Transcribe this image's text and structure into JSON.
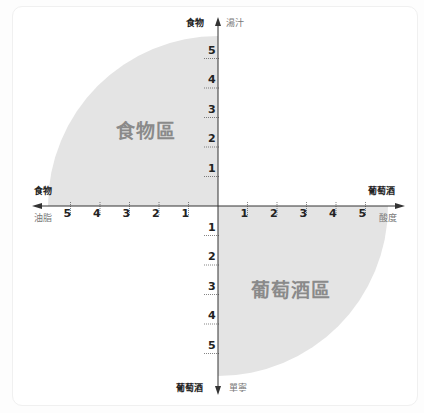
{
  "diagram": {
    "origin": {
      "x": 218,
      "y": 206
    },
    "tick_spacing_px": 29.5,
    "colors": {
      "fill": "#e4e4e4",
      "axis": "#333333",
      "background": "#ffffff"
    },
    "axes": {
      "top": {
        "bold_label": "食物",
        "light_label": "湯汁"
      },
      "bottom": {
        "bold_label": "葡萄酒",
        "light_label": "單寧"
      },
      "left": {
        "bold_label": "食物",
        "light_label": "油脂"
      },
      "right": {
        "bold_label": "葡萄酒",
        "light_label": "酸度"
      }
    },
    "ticks": {
      "up": [
        "1",
        "2",
        "3",
        "4",
        "5"
      ],
      "down": [
        "1",
        "2",
        "3",
        "4",
        "5"
      ],
      "left": [
        "1",
        "2",
        "3",
        "4",
        "5"
      ],
      "right": [
        "1",
        "2",
        "3",
        "4",
        "5"
      ]
    },
    "zones": {
      "top_left": "食物區",
      "bottom_right": "葡萄酒區"
    }
  },
  "chart_data": {
    "type": "scatter",
    "title": "",
    "xlabel_positive": "葡萄酒 酸度",
    "xlabel_negative": "食物 油脂",
    "ylabel_positive": "食物 湯汁",
    "ylabel_negative": "葡萄酒 單寧",
    "x_ticks": [
      -5,
      -4,
      -3,
      -2,
      -1,
      1,
      2,
      3,
      4,
      5
    ],
    "y_ticks": [
      -5,
      -4,
      -3,
      -2,
      -1,
      1,
      2,
      3,
      4,
      5
    ],
    "xlim": [
      -6,
      6
    ],
    "ylim": [
      -6,
      6
    ],
    "regions": [
      {
        "name": "食物區",
        "quadrant": "top-left",
        "shape": "quarter-circle",
        "radius": 5.8
      },
      {
        "name": "葡萄酒區",
        "quadrant": "bottom-right",
        "shape": "quarter-circle",
        "radius": 5.8
      }
    ],
    "grid": false
  }
}
